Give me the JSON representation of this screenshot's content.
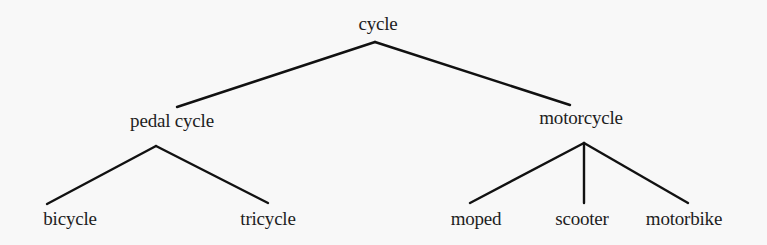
{
  "diagram": {
    "type": "tree",
    "root": {
      "label": "cycle",
      "children": [
        {
          "label": "pedal cycle",
          "children": [
            {
              "label": "bicycle"
            },
            {
              "label": "tricycle"
            }
          ]
        },
        {
          "label": "motorcycle",
          "children": [
            {
              "label": "moped"
            },
            {
              "label": "scooter"
            },
            {
              "label": "motorbike"
            }
          ]
        }
      ]
    }
  },
  "nodes": {
    "cycle": "cycle",
    "pedal_cycle": "pedal cycle",
    "motorcycle": "motorcycle",
    "bicycle": "bicycle",
    "tricycle": "tricycle",
    "moped": "moped",
    "scooter": "scooter",
    "motorbike": "motorbike"
  },
  "colors": {
    "background": "#f8f8f8",
    "line": "#111111",
    "text": "#1e1e1e"
  }
}
